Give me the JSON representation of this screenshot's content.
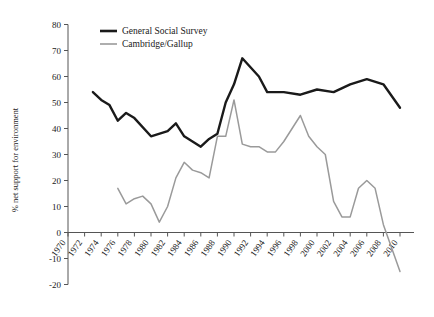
{
  "chart_data": {
    "type": "line",
    "title": "",
    "xlabel": "",
    "ylabel": "% net support for environment",
    "xlim": [
      1970,
      2010
    ],
    "ylim": [
      -20,
      80
    ],
    "ytick_values": [
      -20,
      -10,
      0,
      10,
      20,
      30,
      40,
      50,
      60,
      70,
      80
    ],
    "ytick_labels": [
      "-20",
      "-10",
      "0",
      "10",
      "20",
      "30",
      "40",
      "50",
      "60",
      "70",
      "80"
    ],
    "xtick_values": [
      1970,
      1972,
      1974,
      1976,
      1978,
      1980,
      1982,
      1984,
      1986,
      1988,
      1990,
      1992,
      1994,
      1996,
      1998,
      2000,
      2002,
      2004,
      2006,
      2008,
      2010
    ],
    "xtick_labels": [
      "1970",
      "1972",
      "1974",
      "1976",
      "1978",
      "1980",
      "1982",
      "1984",
      "1986",
      "1988",
      "1990",
      "1992",
      "1994",
      "1996",
      "1998",
      "2000",
      "2002",
      "2004",
      "2006",
      "2008",
      "2010"
    ],
    "grid": false,
    "legend_position": "top-center",
    "series": [
      {
        "name": "General Social Survey",
        "color": "#1a1a1a",
        "x": [
          1973,
          1974,
          1975,
          1976,
          1977,
          1978,
          1980,
          1982,
          1983,
          1984,
          1985,
          1986,
          1987,
          1988,
          1989,
          1990,
          1991,
          1993,
          1994,
          1996,
          1998,
          2000,
          2002,
          2004,
          2006,
          2008,
          2010
        ],
        "values": [
          54,
          51,
          49,
          43,
          46,
          44,
          37,
          39,
          42,
          37,
          35,
          33,
          36,
          38,
          50,
          57,
          67,
          60,
          54,
          54,
          53,
          55,
          54,
          57,
          59,
          57,
          48
        ]
      },
      {
        "name": "Cambridge/Gallup",
        "color": "#9a9a9a",
        "x": [
          1976,
          1977,
          1978,
          1979,
          1980,
          1981,
          1982,
          1983,
          1984,
          1985,
          1986,
          1987,
          1988,
          1989,
          1990,
          1991,
          1992,
          1993,
          1994,
          1995,
          1996,
          1997,
          1998,
          1999,
          2000,
          2001,
          2002,
          2003,
          2004,
          2005,
          2006,
          2007,
          2008,
          2010
        ],
        "values": [
          17,
          11,
          13,
          14,
          11,
          4,
          10,
          21,
          27,
          24,
          23,
          21,
          37,
          37,
          51,
          34,
          33,
          33,
          31,
          31,
          35,
          40,
          45,
          37,
          33,
          30,
          12,
          6,
          6,
          17,
          20,
          17,
          3,
          -15
        ]
      }
    ]
  },
  "legend": {
    "items": [
      {
        "label": "General Social Survey",
        "color": "#1a1a1a"
      },
      {
        "label": "Cambridge/Gallup",
        "color": "#9a9a9a"
      }
    ]
  }
}
